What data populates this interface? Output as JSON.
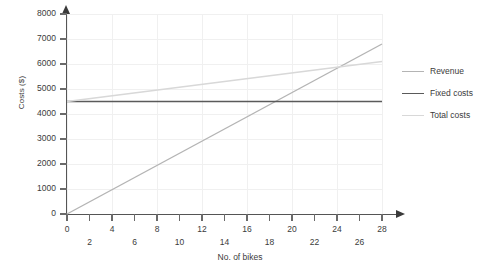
{
  "chart_data": {
    "type": "line",
    "title": "",
    "xlabel": "No. of bikes",
    "ylabel": "Costs ($)",
    "xlim": [
      0,
      28
    ],
    "ylim": [
      0,
      8000
    ],
    "grid": true,
    "legend_position": "right",
    "x_ticks_major": [
      "0",
      "4",
      "8",
      "12",
      "16",
      "20",
      "24",
      "28"
    ],
    "x_ticks_minor": [
      "2",
      "6",
      "10",
      "14",
      "18",
      "22",
      "26"
    ],
    "x_tick_values": [
      0,
      2,
      4,
      6,
      8,
      10,
      12,
      14,
      16,
      18,
      20,
      22,
      24,
      26,
      28
    ],
    "y_ticks": [
      "0",
      "1000",
      "2000",
      "3000",
      "4000",
      "5000",
      "6000",
      "7000",
      "8000"
    ],
    "y_tick_values": [
      0,
      1000,
      2000,
      3000,
      4000,
      5000,
      6000,
      7000,
      8000
    ],
    "series": [
      {
        "name": "Revenue",
        "color": "#b4b4b4",
        "width": 1.4,
        "x": [
          0,
          28
        ],
        "values": [
          0,
          6800
        ]
      },
      {
        "name": "Fixed costs",
        "color": "#5a5a5a",
        "width": 1.6,
        "x": [
          0,
          28
        ],
        "values": [
          4500,
          4500
        ]
      },
      {
        "name": "Total costs",
        "color": "#d8d8d8",
        "width": 1.3,
        "x": [
          0,
          28
        ],
        "values": [
          4500,
          6100
        ]
      }
    ],
    "annotations": []
  },
  "legend": {
    "items": [
      {
        "label": "Revenue",
        "color": "#b4b4b4"
      },
      {
        "label": "Fixed costs",
        "color": "#5a5a5a"
      },
      {
        "label": "Total costs",
        "color": "#d8d8d8"
      }
    ]
  },
  "colors": {
    "background": "#ffffff",
    "axis": "#555555",
    "grid": "#f0f0f0",
    "text": "#3b3b3b"
  }
}
